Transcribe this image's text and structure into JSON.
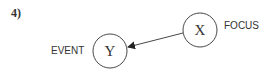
{
  "figure": {
    "number": "4)",
    "nodes": [
      {
        "id": "X",
        "label": "X",
        "annotation": "FOCUS"
      },
      {
        "id": "Y",
        "label": "Y",
        "annotation": "EVENT"
      }
    ],
    "edges": [
      {
        "from": "X",
        "to": "Y",
        "type": "arrow"
      }
    ],
    "colors": {
      "stroke": "#333333",
      "background": "#ffffff"
    }
  }
}
